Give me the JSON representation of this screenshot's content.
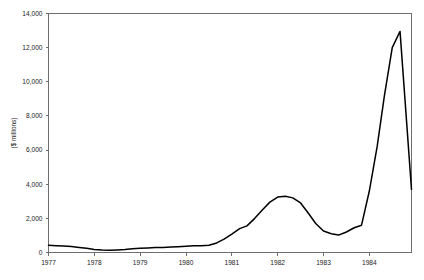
{
  "chart_data": {
    "type": "line",
    "title": "",
    "subtitle": "",
    "xlabel": "",
    "ylabel": "($ millions)",
    "xlim": [
      1977.0,
      1984.92
    ],
    "ylim": [
      0,
      14000
    ],
    "grid": false,
    "legend": null,
    "x_tick_labels": [
      "1977",
      "1978",
      "1979",
      "1980",
      "1981",
      "1982",
      "1983",
      "1984"
    ],
    "x_ticks": [
      1977,
      1978,
      1979,
      1980,
      1981,
      1982,
      1983,
      1984
    ],
    "y_tick_labels": [
      "0",
      "2,000",
      "4,000",
      "6,000",
      "8,000",
      "10,000",
      "12,000",
      "14,000"
    ],
    "y_ticks": [
      0,
      2000,
      4000,
      6000,
      8000,
      10000,
      12000,
      14000
    ],
    "series": [
      {
        "name": "value",
        "color": "#000000",
        "x": [
          1977.0,
          1977.17,
          1977.33,
          1977.5,
          1977.67,
          1977.83,
          1978.0,
          1978.17,
          1978.33,
          1978.5,
          1978.67,
          1978.83,
          1979.0,
          1979.17,
          1979.33,
          1979.5,
          1979.67,
          1979.83,
          1980.0,
          1980.17,
          1980.33,
          1980.5,
          1980.67,
          1980.83,
          1981.0,
          1981.17,
          1981.33,
          1981.5,
          1981.67,
          1981.83,
          1982.0,
          1982.17,
          1982.33,
          1982.5,
          1982.67,
          1982.83,
          1983.0,
          1983.17,
          1983.33,
          1983.5,
          1983.67,
          1983.83,
          1984.0,
          1984.17,
          1984.33,
          1984.5,
          1984.67,
          1984.92
        ],
        "values": [
          420,
          400,
          380,
          350,
          300,
          250,
          170,
          140,
          130,
          150,
          180,
          220,
          250,
          270,
          290,
          300,
          320,
          340,
          370,
          390,
          400,
          430,
          560,
          780,
          1080,
          1400,
          1560,
          2000,
          2500,
          2950,
          3250,
          3300,
          3200,
          2900,
          2300,
          1700,
          1260,
          1100,
          1020,
          1200,
          1450,
          1600,
          3600,
          6200,
          9200,
          12000,
          12950,
          3700
        ]
      }
    ],
    "annotations": []
  },
  "figure": {
    "background_color": "#ffffff",
    "frame_color": "#6e6e6e",
    "text_color": "#1a1a1a"
  }
}
